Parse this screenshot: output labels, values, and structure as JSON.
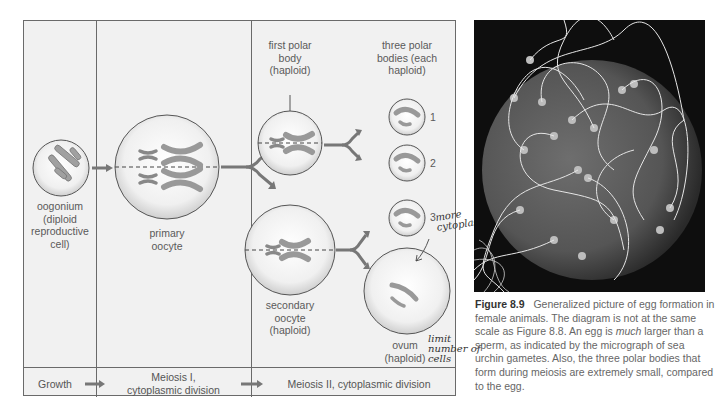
{
  "diagram": {
    "labels": {
      "oogonium": "oogonium\n(diploid\nreproductive\ncell)",
      "primary_oocyte": "primary\noocyte",
      "first_polar_body": "first polar\nbody\n(haploid)",
      "three_polar_bodies": "three polar\nbodies (each\nhaploid)",
      "secondary_oocyte": "secondary\noocyte\n(haploid)",
      "ovum": "ovum\n(haploid)",
      "polar_numbers": [
        "1",
        "2",
        "3"
      ]
    },
    "stages": {
      "growth": "Growth",
      "meiosis1": "Meiosis I,\ncytoplasmic division",
      "meiosis2": "Meiosis II, cytoplasmic division"
    }
  },
  "handwritten": {
    "note1": "more\ncytoplas",
    "note2": "limit\nnumber of\ncells"
  },
  "photo": {
    "description": "micrograph of sea urchin gametes"
  },
  "caption": {
    "figure_label": "Figure 8.9",
    "text_1": "Generalized picture of egg formation in female animals. The diagram is not at the same scale as Figure 8.8. An egg is ",
    "emphasis": "much",
    "text_2": " larger than a sperm, as indicated by the micrograph of sea urchin gametes. Also, the three polar bodies that form during meiosis are extremely small, compared to the egg."
  },
  "colors": {
    "panel_bg": "#f1f1f1",
    "chromosome": "#9a9a9a",
    "arrow": "#777777",
    "line": "#6a6a6a"
  }
}
